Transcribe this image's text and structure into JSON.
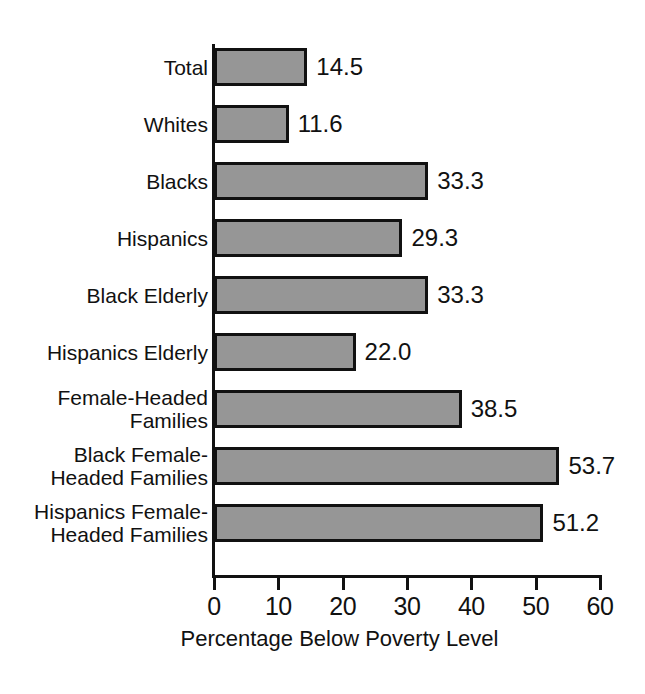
{
  "chart_data": {
    "type": "bar",
    "orientation": "horizontal",
    "title": "",
    "xlabel": "Percentage Below Poverty Level",
    "ylabel": "",
    "xlim": [
      0,
      60
    ],
    "xticks": [
      0,
      10,
      20,
      30,
      40,
      50,
      60
    ],
    "xtick_labels": [
      "0",
      "10",
      "20",
      "30",
      "40",
      "50",
      "60"
    ],
    "grid": false,
    "legend": false,
    "bar_color": "#969696",
    "bar_edge_color": "#111111",
    "background": "#ffffff",
    "categories": [
      "Total",
      "Whites",
      "Blacks",
      "Hispanics",
      "Black Elderly",
      "Hispanics Elderly",
      "Female-Headed\nFamilies",
      "Black Female-\nHeaded Families",
      "Hispanics Female-\nHeaded Families"
    ],
    "values": [
      14.5,
      11.6,
      33.3,
      29.3,
      33.3,
      22.0,
      38.5,
      53.7,
      51.2
    ],
    "value_labels": [
      "14.5",
      "11.6",
      "33.3",
      "29.3",
      "33.3",
      "22.0",
      "38.5",
      "53.7",
      "51.2"
    ]
  }
}
